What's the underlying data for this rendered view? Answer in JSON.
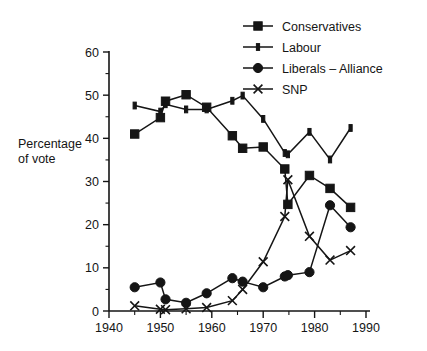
{
  "chart_data": {
    "type": "line",
    "title": "",
    "xlabel": "",
    "ylabel_line1": "Percentage",
    "ylabel_line2": "of vote",
    "xlim": [
      1940,
      1990
    ],
    "ylim": [
      0,
      60
    ],
    "x_ticks": [
      1940,
      1950,
      1960,
      1970,
      1980,
      1990
    ],
    "x_tick_labels": [
      "1940",
      "1950",
      "1960",
      "1970",
      "1980",
      "1990"
    ],
    "x_minor_ticks": [
      1945,
      1955,
      1965,
      1975,
      1985
    ],
    "y_ticks": [
      0,
      10,
      20,
      30,
      40,
      50,
      60
    ],
    "y_tick_labels": [
      "0",
      "10",
      "20",
      "30",
      "40",
      "50",
      "60"
    ],
    "y_minor_ticks": [
      5,
      15,
      25,
      35,
      45,
      55
    ],
    "grid": false,
    "legend_position": "top-right",
    "series": [
      {
        "name": "Conservatives",
        "marker": "filled-square",
        "x": [
          1945,
          1950,
          1951,
          1955,
          1959,
          1964,
          1966,
          1970,
          1974.2,
          1974.8,
          1979,
          1983,
          1987
        ],
        "values": [
          41.0,
          44.8,
          48.6,
          50.1,
          47.2,
          40.6,
          37.7,
          38.0,
          32.9,
          24.7,
          31.4,
          28.4,
          24.0
        ]
      },
      {
        "name": "Labour",
        "marker": "small-plus",
        "x": [
          1945,
          1950,
          1951,
          1955,
          1959,
          1964,
          1966,
          1970,
          1974.2,
          1974.8,
          1979,
          1983,
          1987
        ],
        "values": [
          47.6,
          46.2,
          47.9,
          46.7,
          46.7,
          48.7,
          49.9,
          44.5,
          36.6,
          36.3,
          41.5,
          35.1,
          42.4
        ]
      },
      {
        "name": "Liberals – Alliance",
        "marker": "filled-circle",
        "x": [
          1945,
          1950,
          1951,
          1955,
          1959,
          1964,
          1966,
          1970,
          1974.2,
          1974.8,
          1979,
          1983,
          1987
        ],
        "values": [
          5.5,
          6.6,
          2.7,
          1.9,
          4.1,
          7.6,
          6.8,
          5.5,
          8.0,
          8.3,
          9.0,
          24.5,
          19.4
        ]
      },
      {
        "name": "SNP",
        "marker": "x-cross",
        "x": [
          1945,
          1950,
          1951,
          1955,
          1959,
          1964,
          1966,
          1970,
          1974.2,
          1974.8,
          1979,
          1983,
          1987
        ],
        "values": [
          1.2,
          0.4,
          0.3,
          0.5,
          0.8,
          2.4,
          5.0,
          11.4,
          21.9,
          30.4,
          17.3,
          11.8,
          14.0
        ]
      }
    ],
    "legend_entries": [
      {
        "label": "Conservatives",
        "marker": "filled-square"
      },
      {
        "label": "Labour",
        "marker": "small-plus"
      },
      {
        "label": "Liberals – Alliance",
        "marker": "filled-circle"
      },
      {
        "label": "SNP",
        "marker": "x-cross"
      }
    ],
    "colors": {
      "ink": "#151515",
      "background": "#ffffff"
    }
  }
}
